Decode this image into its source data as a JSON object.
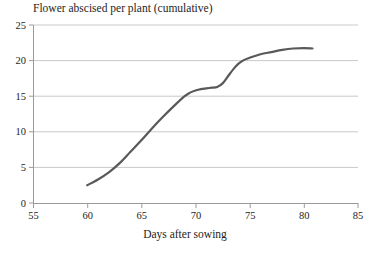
{
  "chart_data": {
    "type": "line",
    "title": "Flower abscised per plant (cumulative)",
    "xlabel": "Days after sowing",
    "ylabel": "",
    "xlim": [
      55,
      85
    ],
    "ylim": [
      0,
      25
    ],
    "xticks": [
      55,
      60,
      65,
      70,
      75,
      80,
      85
    ],
    "yticks": [
      0,
      5,
      10,
      15,
      20,
      25
    ],
    "grid": "horizontal",
    "legend": "none",
    "line_color": "#595959",
    "grid_color": "#c9c9c9",
    "axis_color": "#9a9a9a",
    "background": "#ffffff",
    "series": [
      {
        "name": "Flower abscised per plant (cumulative)",
        "x": [
          60.0,
          61.0,
          62.0,
          63.0,
          64.0,
          65.0,
          66.0,
          67.0,
          68.0,
          69.0,
          69.5,
          70.0,
          70.5,
          71.0,
          71.5,
          72.0,
          72.5,
          73.0,
          73.5,
          74.0,
          74.5,
          75.0,
          76.0,
          77.0,
          78.0,
          79.0,
          80.0,
          80.8
        ],
        "y": [
          2.5,
          3.3,
          4.3,
          5.6,
          7.2,
          8.8,
          10.5,
          12.1,
          13.6,
          15.0,
          15.5,
          15.8,
          16.0,
          16.1,
          16.2,
          16.3,
          16.8,
          17.8,
          18.8,
          19.6,
          20.1,
          20.4,
          20.9,
          21.2,
          21.5,
          21.7,
          21.75,
          21.7
        ]
      }
    ]
  },
  "axis": {
    "y_tick_labels": [
      "25",
      "20",
      "15",
      "10",
      "5",
      "0"
    ],
    "x_tick_labels": [
      "55",
      "60",
      "65",
      "70",
      "75",
      "80",
      "85"
    ]
  }
}
